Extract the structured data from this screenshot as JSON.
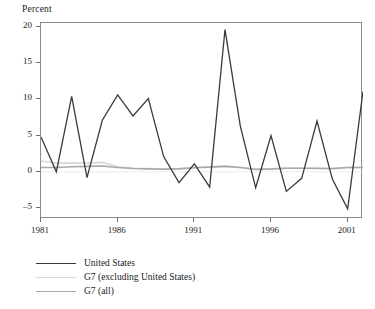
{
  "chart_data": {
    "type": "line",
    "title": "Percent",
    "xlabel": "",
    "ylabel": "Percent",
    "xlim": [
      1981,
      2002
    ],
    "ylim": [
      -6.5,
      20.5
    ],
    "grid": false,
    "legend_position": "below",
    "y_ticks": [
      20,
      15,
      10,
      5,
      0,
      -5
    ],
    "y_tick_labels": [
      "20",
      "15",
      "10",
      "5",
      "0",
      "–5"
    ],
    "x_ticks": [
      1981,
      1986,
      1991,
      1996,
      2001
    ],
    "x_tick_labels": [
      "1981",
      "1986",
      "1991",
      "1996",
      "2001"
    ],
    "x": [
      1981,
      1982,
      1983,
      1984,
      1985,
      1986,
      1987,
      1988,
      1989,
      1990,
      1991,
      1992,
      1993,
      1994,
      1995,
      1996,
      1997,
      1998,
      1999,
      2000,
      2001,
      2002
    ],
    "series": [
      {
        "name": "United States",
        "color": "#3a3a3a",
        "width": 1.3,
        "values": [
          4.8,
          0.0,
          10.4,
          -0.8,
          7.1,
          10.6,
          7.7,
          10.1,
          2.1,
          -1.5,
          1.1,
          -2.1,
          19.6,
          6.3,
          -2.2,
          5.0,
          -2.7,
          -0.9,
          7.0,
          -1.0,
          -5.1,
          11.1
        ]
      },
      {
        "name": "G7 (excluding United States)",
        "color": "#d8d8d8",
        "width": 1.6,
        "values": [
          1.5,
          1.2,
          1.2,
          1.2,
          1.3,
          0.7,
          0.5,
          0.45,
          0.4,
          0.45,
          0.6,
          0.7,
          0.8,
          0.6,
          0.3,
          0.35,
          0.5,
          0.5,
          0.45,
          0.4,
          0.6,
          0.6
        ]
      },
      {
        "name": "G7 (all)",
        "color": "#a9a9a9",
        "width": 1.6,
        "values": [
          0.6,
          0.6,
          0.7,
          0.75,
          0.8,
          0.6,
          0.45,
          0.4,
          0.35,
          0.4,
          0.55,
          0.65,
          0.75,
          0.6,
          0.35,
          0.4,
          0.5,
          0.5,
          0.5,
          0.45,
          0.6,
          0.6
        ]
      }
    ]
  },
  "legend": {
    "items": [
      {
        "label": "United States"
      },
      {
        "label": "G7 (excluding United States)"
      },
      {
        "label": "G7 (all)"
      }
    ]
  }
}
